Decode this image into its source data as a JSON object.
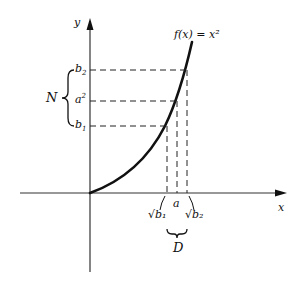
{
  "diagram": {
    "function_label": "f(x) = x²",
    "axes": {
      "x_label": "x",
      "y_label": "y"
    },
    "y_marks": [
      {
        "id": "b2",
        "label_base": "b",
        "label_sub": "2",
        "y": 70
      },
      {
        "id": "a2",
        "label_base": "a",
        "label_sup": "2",
        "y": 101
      },
      {
        "id": "b1",
        "label_base": "b",
        "label_sub": "1",
        "y": 126
      }
    ],
    "x_marks": [
      {
        "id": "sqrt_b1",
        "label": "√b₁",
        "x": 167
      },
      {
        "id": "a",
        "label": "a",
        "x": 177
      },
      {
        "id": "sqrt_b2",
        "label": "√b₂",
        "x": 186
      }
    ],
    "brace_labels": {
      "neighborhood_y": "N",
      "neighborhood_x": "D"
    },
    "colors": {
      "ink": "#111111",
      "axis": "#333333",
      "background": "#ffffff"
    }
  }
}
